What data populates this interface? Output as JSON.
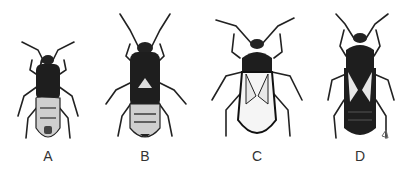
{
  "figure": {
    "specimens": [
      {
        "label": "A",
        "center_x": 48
      },
      {
        "label": "B",
        "center_x": 145
      },
      {
        "label": "C",
        "center_x": 257
      },
      {
        "label": "D",
        "center_x": 360
      }
    ]
  }
}
